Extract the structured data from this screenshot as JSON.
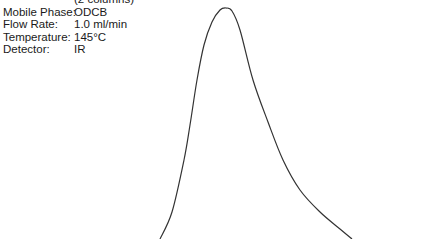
{
  "conditions": {
    "column_note": "(2 columns)",
    "rows": [
      {
        "label": "Mobile Phase:",
        "value": "ODCB"
      },
      {
        "label": "Flow Rate:",
        "value": "1.0 ml/min"
      },
      {
        "label": "Temperature:",
        "value": "145°C"
      },
      {
        "label": "Detector:",
        "value": "IR"
      }
    ]
  },
  "chart_data": {
    "type": "line",
    "title": "",
    "xlabel": "",
    "ylabel": "",
    "grid": false,
    "legend": null,
    "series": [
      {
        "name": "IR detector signal",
        "points_px": [
          [
            160,
            239
          ],
          [
            172,
            212
          ],
          [
            184,
            160
          ],
          [
            190,
            125
          ],
          [
            197,
            80
          ],
          [
            204,
            45
          ],
          [
            212,
            22
          ],
          [
            220,
            10
          ],
          [
            226,
            8
          ],
          [
            232,
            11
          ],
          [
            240,
            30
          ],
          [
            253,
            80
          ],
          [
            268,
            122
          ],
          [
            283,
            160
          ],
          [
            300,
            190
          ],
          [
            320,
            212
          ],
          [
            340,
            229
          ],
          [
            352,
            239
          ]
        ]
      }
    ],
    "line_color": "#333333"
  }
}
